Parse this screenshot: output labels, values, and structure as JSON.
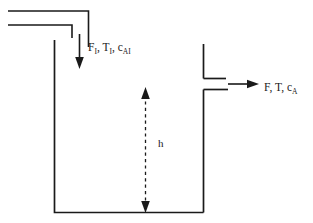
{
  "diagram": {
    "type": "process-flow-schematic",
    "colors": {
      "line": "#1a1a1a",
      "background": "#ffffff",
      "label": "#1a1a1a"
    },
    "labels": {
      "inlet": {
        "flow": "F",
        "flow_subscript": "I",
        "temperature": "T",
        "temperature_subscript": "I",
        "concentration": "c",
        "concentration_subscript": "AI",
        "full_text": "F_I, T_I, c_AI"
      },
      "outlet": {
        "flow": "F",
        "temperature": "T",
        "concentration": "c",
        "concentration_subscript": "A",
        "full_text": "F, T, c_A"
      },
      "level": {
        "symbol": "h",
        "full_text": "h"
      }
    },
    "elements": {
      "tank_name": "tank-vessel",
      "inlet_pipe_name": "inlet-pipe",
      "outlet_pipe_name": "outlet-pipe",
      "inlet_arrow_name": "inlet-flow-arrow",
      "outlet_arrow_name": "outlet-flow-arrow",
      "level_arrow_name": "liquid-level-dimension-arrow"
    }
  }
}
